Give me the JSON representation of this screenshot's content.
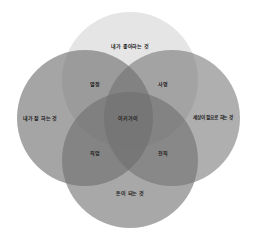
{
  "diagram": {
    "type": "venn",
    "title": "",
    "circles": [
      {
        "id": "love",
        "label": "내가 좋아하는 것",
        "color": "#e4e4e4",
        "opacity": 0.95,
        "cx": 130,
        "cy": 80,
        "r": 68,
        "label_x": 130,
        "label_y": 45
      },
      {
        "id": "good",
        "label": "내가 잘 하는 것",
        "color": "#6e6e6e",
        "opacity": 0.62,
        "cx": 85,
        "cy": 118,
        "r": 68,
        "label_x": 40,
        "label_y": 117
      },
      {
        "id": "needs",
        "label": "세상이 필요로 하는 것",
        "color": "#6e6e6e",
        "opacity": 0.55,
        "cx": 172,
        "cy": 118,
        "r": 68,
        "label_x": 213,
        "label_y": 117
      },
      {
        "id": "paid",
        "label": "돈이 되는 것",
        "color": "#6e6e6e",
        "opacity": 0.6,
        "cx": 130,
        "cy": 160,
        "r": 68,
        "label_x": 130,
        "label_y": 192
      }
    ],
    "intersections": [
      {
        "id": "passion",
        "label": "열정",
        "x": 95,
        "y": 83
      },
      {
        "id": "mission",
        "label": "사명",
        "x": 163,
        "y": 83
      },
      {
        "id": "profession",
        "label": "직업",
        "x": 95,
        "y": 152
      },
      {
        "id": "vocation",
        "label": "천직",
        "x": 163,
        "y": 152
      }
    ],
    "center": {
      "label": "이키가이",
      "x": 128,
      "y": 117
    }
  }
}
